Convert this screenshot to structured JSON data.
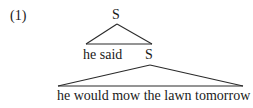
{
  "example": {
    "number": "(1)"
  },
  "tree": {
    "root": {
      "label": "S"
    },
    "upper_triangle_left": {
      "label": "he said"
    },
    "embedded": {
      "label": "S"
    },
    "lower_triangle": {
      "label": "he would mow the lawn tomorrow"
    }
  },
  "colors": {
    "ink": "#1a1a1a",
    "background": "#ffffff"
  }
}
